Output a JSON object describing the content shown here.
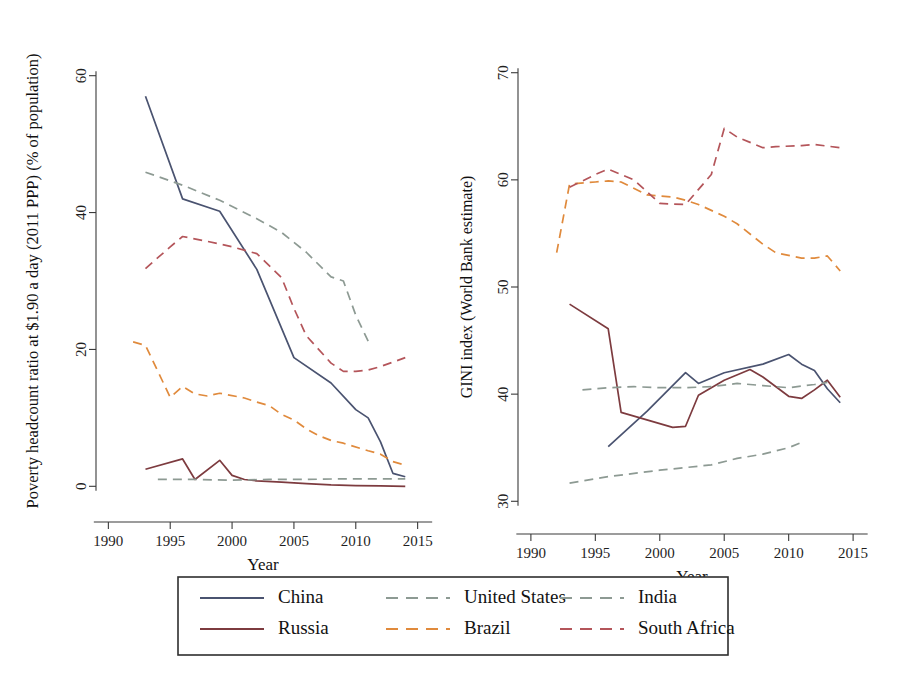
{
  "figure": {
    "background": "#ffffff",
    "panels": [
      "poverty",
      "gini"
    ]
  },
  "legend": {
    "name": "chart-legend",
    "entries": [
      {
        "label": "China",
        "color": "#4a5370",
        "style": "solid"
      },
      {
        "label": "Russia",
        "color": "#7d3b3f",
        "style": "solid"
      },
      {
        "label": "United States",
        "color": "#8d9a93",
        "style": "dashed"
      },
      {
        "label": "Brazil",
        "color": "#e08a3c",
        "style": "dashed"
      },
      {
        "label": "India",
        "color": "#8d9a93",
        "style": "dashed"
      },
      {
        "label": "South Africa",
        "color": "#b4555a",
        "style": "dashed"
      }
    ]
  },
  "chart_data": [
    {
      "type": "line",
      "id": "poverty",
      "title": "",
      "xlabel": "Year",
      "ylabel": "Poverty headcount ratio at $1.90 a day (2011 PPP) (% of population)",
      "xlim": [
        1989,
        2016
      ],
      "ylim": [
        -2,
        62
      ],
      "xticks": [
        1990,
        1995,
        2000,
        2005,
        2010,
        2015
      ],
      "yticks": [
        0,
        20,
        40,
        60
      ],
      "grid": false,
      "legend_position": "below-figure",
      "series": [
        {
          "name": "China",
          "color": "#4a5370",
          "style": "solid",
          "x": [
            1993,
            1996,
            1999,
            2002,
            2005,
            2008,
            2010,
            2011,
            2012,
            2013,
            2014
          ],
          "values": [
            57.0,
            42.0,
            40.2,
            31.7,
            18.8,
            15.1,
            11.2,
            10.0,
            6.5,
            1.9,
            1.4
          ]
        },
        {
          "name": "Brazil",
          "color": "#e08a3c",
          "style": "dashed",
          "x": [
            1992,
            1993,
            1995,
            1996,
            1997,
            1998,
            1999,
            2001,
            2002,
            2003,
            2004,
            2005,
            2006,
            2007,
            2008,
            2009,
            2011,
            2012,
            2013,
            2014
          ],
          "values": [
            21.1,
            20.6,
            13.0,
            14.6,
            13.5,
            13.2,
            13.6,
            12.9,
            12.3,
            11.8,
            10.5,
            9.7,
            8.4,
            7.4,
            6.7,
            6.3,
            5.2,
            4.7,
            3.6,
            3.1
          ]
        },
        {
          "name": "Russia",
          "color": "#7d3b3f",
          "style": "solid",
          "x": [
            1993,
            1996,
            1997,
            1999,
            2000,
            2001,
            2002,
            2004,
            2006,
            2008,
            2010,
            2012,
            2014
          ],
          "values": [
            2.5,
            4.0,
            1.0,
            3.8,
            1.6,
            1.0,
            0.8,
            0.6,
            0.4,
            0.2,
            0.1,
            0.05,
            0.0
          ]
        },
        {
          "name": "India",
          "color": "#8d9a93",
          "style": "dashed",
          "x": [
            1993,
            1996,
            1999,
            2002,
            2004,
            2006,
            2008,
            2009,
            2010,
            2011
          ],
          "values": [
            45.9,
            44.0,
            41.8,
            39.1,
            37.1,
            34.2,
            30.6,
            30.0,
            25.0,
            21.2
          ]
        },
        {
          "name": "United States",
          "color": "#8d9a93",
          "style": "dashed",
          "x": [
            1994,
            1997,
            2000,
            2003,
            2006,
            2009,
            2011,
            2013,
            2014
          ],
          "values": [
            1.0,
            1.0,
            0.9,
            1.0,
            1.0,
            1.1,
            1.1,
            1.1,
            1.1
          ]
        },
        {
          "name": "South Africa",
          "color": "#b4555a",
          "style": "dashed",
          "x": [
            1993,
            1995,
            1996,
            1998,
            2000,
            2002,
            2004,
            2005,
            2006,
            2008,
            2009,
            2010,
            2011,
            2012,
            2014
          ],
          "values": [
            31.8,
            35.0,
            36.5,
            35.8,
            35.0,
            34.0,
            30.5,
            26.0,
            22.0,
            18.0,
            16.8,
            16.8,
            17.0,
            17.5,
            18.8
          ]
        }
      ]
    },
    {
      "type": "line",
      "id": "gini",
      "title": "",
      "xlabel": "Year",
      "ylabel": "GINI index (World Bank estimate)",
      "xlim": [
        1989,
        2016
      ],
      "ylim": [
        29,
        71
      ],
      "xticks": [
        1990,
        1995,
        2000,
        2005,
        2010,
        2015
      ],
      "yticks": [
        30,
        40,
        50,
        60,
        70
      ],
      "grid": false,
      "legend_position": "below-figure",
      "series": [
        {
          "name": "China",
          "color": "#4a5370",
          "style": "solid",
          "x": [
            1996,
            1999,
            2002,
            2003,
            2005,
            2008,
            2010,
            2011,
            2012,
            2013,
            2014
          ],
          "values": [
            35.1,
            38.4,
            42.0,
            41.0,
            42.0,
            42.8,
            43.7,
            42.8,
            42.2,
            40.5,
            39.2
          ]
        },
        {
          "name": "Brazil",
          "color": "#e08a3c",
          "style": "dashed",
          "x": [
            1992,
            1993,
            1995,
            1996,
            1997,
            1999,
            2001,
            2002,
            2003,
            2005,
            2006,
            2008,
            2009,
            2011,
            2012,
            2013,
            2014
          ],
          "values": [
            53.2,
            59.6,
            59.8,
            59.9,
            59.8,
            58.6,
            58.4,
            58.1,
            57.7,
            56.6,
            55.9,
            54.0,
            53.2,
            52.7,
            52.7,
            52.9,
            51.5
          ]
        },
        {
          "name": "Russia",
          "color": "#7d3b3f",
          "style": "solid",
          "x": [
            1993,
            1996,
            1997,
            1999,
            2001,
            2002,
            2003,
            2005,
            2007,
            2008,
            2010,
            2011,
            2012,
            2013,
            2014
          ],
          "values": [
            48.4,
            46.1,
            38.3,
            37.6,
            36.9,
            37.0,
            39.9,
            41.3,
            42.3,
            41.6,
            39.8,
            39.6,
            40.4,
            41.3,
            39.7
          ]
        },
        {
          "name": "India",
          "color": "#8d9a93",
          "style": "dashed",
          "x": [
            1993,
            1996,
            2000,
            2004,
            2006,
            2008,
            2010,
            2011
          ],
          "values": [
            31.7,
            32.3,
            32.9,
            33.4,
            34.0,
            34.4,
            35.0,
            35.5
          ]
        },
        {
          "name": "United States",
          "color": "#8d9a93",
          "style": "dashed",
          "x": [
            1994,
            1996,
            1998,
            2000,
            2002,
            2004,
            2006,
            2008,
            2010,
            2012,
            2013
          ],
          "values": [
            40.4,
            40.6,
            40.7,
            40.6,
            40.6,
            40.7,
            41.0,
            40.8,
            40.6,
            40.9,
            41.1
          ]
        },
        {
          "name": "South Africa",
          "color": "#b4555a",
          "style": "dashed",
          "x": [
            1993,
            1995,
            1996,
            1998,
            2000,
            2002,
            2004,
            2005,
            2006,
            2008,
            2009,
            2011,
            2012,
            2014
          ],
          "values": [
            59.3,
            60.5,
            61.0,
            60.0,
            57.8,
            57.7,
            60.5,
            64.8,
            64.0,
            63.0,
            63.1,
            63.2,
            63.3,
            63.0
          ]
        }
      ]
    }
  ]
}
